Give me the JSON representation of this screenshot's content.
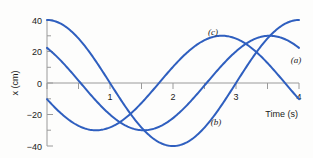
{
  "chart_data": {
    "type": "line",
    "title": "",
    "xlabel": "Time (s)",
    "ylabel": "x (cm)",
    "xlim": [
      0,
      4
    ],
    "ylim": [
      -40,
      40
    ],
    "xticks": [
      "1",
      "2",
      "3",
      "4"
    ],
    "xtick_values": [
      1,
      2,
      3,
      4
    ],
    "yticks": [
      "40",
      "20",
      "0",
      "−20",
      "−40"
    ],
    "ytick_values": [
      40,
      20,
      0,
      -20,
      -40
    ],
    "y_minor_ticks": [
      30,
      10,
      -10,
      -30
    ],
    "grid": false,
    "legend_position": "inline-annotations",
    "line_color": "#2f5fbf",
    "axis_color": "#9a9a9a",
    "series": [
      {
        "name": "(a)",
        "label": "(a)",
        "amplitude": 30,
        "period": 4,
        "phase_deg": 42,
        "description": "starts near 20 cm rising to peak 30 cm at t≈0.9 s, minimum −30 cm near t≈2.9 s, ends near 20 cm",
        "x": [
          0,
          0.2,
          0.4,
          0.6,
          0.8,
          1.0,
          1.2,
          1.4,
          1.6,
          1.8,
          2.0,
          2.2,
          2.4,
          2.6,
          2.8,
          3.0,
          3.2,
          3.4,
          3.6,
          3.8,
          4.0
        ],
        "y": [
          20.1,
          24.6,
          27.9,
          29.7,
          30.0,
          28.6,
          25.8,
          21.7,
          16.5,
          10.4,
          3.8,
          -3.0,
          -9.6,
          -15.8,
          -21.2,
          -25.6,
          -28.6,
          -30.0,
          -29.8,
          -27.9,
          -24.5
        ]
      },
      {
        "name": "(b)",
        "label": "(b)",
        "amplitude": 30,
        "period": 4,
        "phase_deg": 110,
        "description": "starts near 28 cm decreasing, crosses zero near t≈0.6 s, deep minimum near −30 cm at t≈2.6 s, rises steeply to about 30 cm at t = 4 s",
        "x": [
          0,
          0.2,
          0.4,
          0.6,
          0.8,
          1.0,
          1.2,
          1.4,
          1.6,
          1.8,
          2.0,
          2.2,
          2.4,
          2.6,
          2.8,
          3.0,
          3.2,
          3.4,
          3.6,
          3.8,
          4.0
        ],
        "y": [
          28.2,
          24.2,
          19.0,
          12.9,
          6.1,
          -0.9,
          -7.9,
          -14.4,
          -20.2,
          -24.9,
          -28.2,
          -29.9,
          -29.9,
          -28.2,
          -24.9,
          -20.2,
          -14.4,
          -7.9,
          -0.9,
          6.1,
          12.9
        ]
      },
      {
        "name": "(c)",
        "label": "(c)",
        "amplitude": 40,
        "period": 4,
        "phase_deg": 0,
        "description": "starts at 0 cm rising, crosses 20 cm early, minimum −40 cm at t≈1.7 s, maximum 40 cm at t≈3.5 s, ends near 30 cm",
        "x": [
          0,
          0.2,
          0.4,
          0.6,
          0.8,
          1.0,
          1.2,
          1.4,
          1.6,
          1.8,
          2.0,
          2.2,
          2.4,
          2.6,
          2.8,
          3.0,
          3.2,
          3.4,
          3.6,
          3.8,
          4.0
        ],
        "y": [
          0,
          12.4,
          23.5,
          32.4,
          38.0,
          40.0,
          38.0,
          32.4,
          23.5,
          12.4,
          0,
          -12.4,
          -23.5,
          -32.4,
          -38.0,
          -40.0,
          -38.0,
          -32.4,
          -23.5,
          -12.4,
          0
        ]
      }
    ],
    "annotations": [
      {
        "text": "(a)",
        "x": 4.0,
        "y": 14
      },
      {
        "text": "(b)",
        "x": 2.95,
        "y": -26
      },
      {
        "text": "(c)",
        "x": 3.0,
        "y": 26
      }
    ]
  }
}
